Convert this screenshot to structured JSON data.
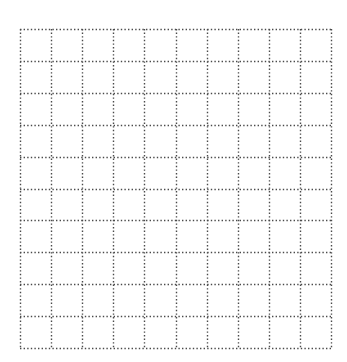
{
  "grid": {
    "columns": 10,
    "rows": 10,
    "origin_x": 20,
    "origin_y": 29,
    "width": 311,
    "height": 319,
    "line_color": "#4a4a4a",
    "line_style": "dotted",
    "background": "#ffffff"
  }
}
